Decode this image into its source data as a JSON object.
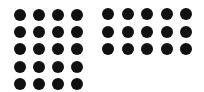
{
  "groups": [
    {
      "name": "left-dot-grid",
      "columns": 4,
      "rows": 5,
      "count": 20,
      "origin": [
        20,
        15
      ],
      "spacing": [
        19,
        17.2
      ],
      "color": "#111111"
    },
    {
      "name": "right-dot-grid",
      "columns": 5,
      "rows": 3,
      "count": 15,
      "origin": [
        108,
        14
      ],
      "spacing": [
        19.5,
        17.5
      ],
      "color": "#111111"
    }
  ],
  "dot_diameter": 12,
  "total_dots": 35
}
